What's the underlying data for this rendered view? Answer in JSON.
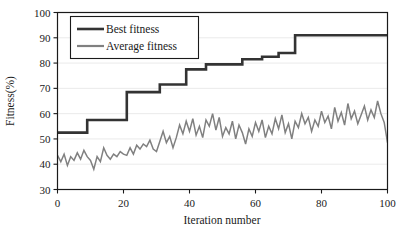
{
  "chart_data": {
    "type": "line",
    "title": "",
    "xlabel": "Iteration number",
    "ylabel": "Fitness(%)",
    "xlim": [
      0,
      100
    ],
    "ylim": [
      30,
      100
    ],
    "xticks": [
      0,
      20,
      40,
      60,
      80,
      100
    ],
    "yticks": [
      30,
      40,
      50,
      60,
      70,
      80,
      90,
      100
    ],
    "grid": "horizontal-faint",
    "legend_position": "top-left-inside",
    "colors": {
      "best": "#333333",
      "average": "#808080",
      "axis": "#1a1a1a",
      "grid": "#e8e8e8",
      "background": "#ffffff"
    },
    "series": [
      {
        "name": "Best fitness",
        "color": "#333333",
        "style": "step",
        "x": [
          0,
          9,
          9,
          21,
          21,
          31,
          31,
          39,
          39,
          45,
          45,
          56,
          56,
          62,
          62,
          67,
          67,
          72,
          72,
          100
        ],
        "values": [
          52.5,
          52.5,
          57.5,
          57.5,
          68.5,
          68.5,
          71.5,
          71.5,
          77.5,
          77.5,
          79.5,
          79.5,
          81.5,
          81.5,
          82.5,
          82.5,
          84.0,
          84.0,
          91.0,
          91.0
        ]
      },
      {
        "name": "Average fitness",
        "color": "#808080",
        "style": "line",
        "x": [
          0,
          1,
          2,
          3,
          4,
          5,
          6,
          7,
          8,
          9,
          10,
          11,
          12,
          13,
          14,
          15,
          16,
          17,
          18,
          19,
          20,
          21,
          22,
          23,
          24,
          25,
          26,
          27,
          28,
          29,
          30,
          31,
          32,
          33,
          34,
          35,
          36,
          37,
          38,
          39,
          40,
          41,
          42,
          43,
          44,
          45,
          46,
          47,
          48,
          49,
          50,
          51,
          52,
          53,
          54,
          55,
          56,
          57,
          58,
          59,
          60,
          61,
          62,
          63,
          64,
          65,
          66,
          67,
          68,
          69,
          70,
          71,
          72,
          73,
          74,
          75,
          76,
          77,
          78,
          79,
          80,
          81,
          82,
          83,
          84,
          85,
          86,
          87,
          88,
          89,
          90,
          91,
          92,
          93,
          94,
          95,
          96,
          97,
          98,
          99,
          100
        ],
        "values": [
          43.5,
          41.0,
          44.0,
          39.5,
          43.0,
          41.5,
          44.5,
          42.0,
          45.5,
          43.0,
          41.5,
          38.0,
          43.0,
          41.0,
          46.5,
          43.5,
          42.0,
          44.0,
          43.0,
          45.0,
          44.0,
          43.5,
          46.5,
          44.0,
          47.5,
          46.0,
          48.0,
          47.0,
          49.5,
          46.0,
          45.0,
          49.0,
          53.0,
          48.5,
          51.0,
          46.5,
          50.5,
          55.5,
          52.0,
          57.0,
          53.0,
          58.0,
          51.5,
          55.0,
          50.5,
          57.5,
          55.0,
          60.0,
          53.5,
          58.5,
          51.0,
          54.5,
          52.0,
          57.0,
          50.0,
          55.5,
          52.5,
          48.0,
          54.0,
          51.0,
          56.5,
          53.0,
          57.5,
          50.5,
          55.0,
          52.0,
          58.0,
          54.0,
          59.5,
          52.5,
          56.0,
          50.0,
          57.0,
          54.5,
          60.0,
          56.0,
          58.5,
          53.0,
          57.5,
          55.0,
          61.0,
          56.5,
          59.0,
          54.0,
          62.5,
          57.0,
          60.5,
          55.5,
          64.0,
          58.0,
          61.0,
          56.0,
          59.5,
          63.0,
          57.5,
          61.5,
          58.5,
          65.0,
          60.0,
          56.5,
          48.5
        ]
      }
    ]
  },
  "legend": {
    "entries": [
      {
        "label": "Best fitness"
      },
      {
        "label": "Average fitness"
      }
    ]
  },
  "axes": {
    "x_title": "Iteration number",
    "y_title": "Fitness(%)",
    "x_tick_labels": [
      "0",
      "20",
      "40",
      "60",
      "80",
      "100"
    ],
    "y_tick_labels": [
      "30",
      "40",
      "50",
      "60",
      "70",
      "80",
      "90",
      "100"
    ]
  }
}
